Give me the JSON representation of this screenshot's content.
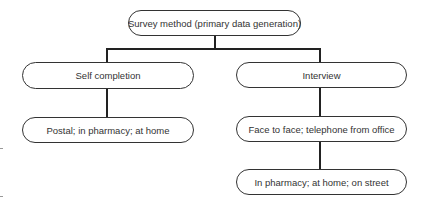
{
  "diagram": {
    "root": {
      "label": "Survey method (primary data generation)"
    },
    "branches": [
      {
        "label": "Self completion",
        "children": [
          {
            "label": "Postal; in pharmacy; at home"
          }
        ]
      },
      {
        "label": "Interview",
        "children": [
          {
            "label": "Face to face; telephone from office",
            "children": [
              {
                "label": "In pharmacy; at home; on street"
              }
            ]
          }
        ]
      }
    ]
  }
}
